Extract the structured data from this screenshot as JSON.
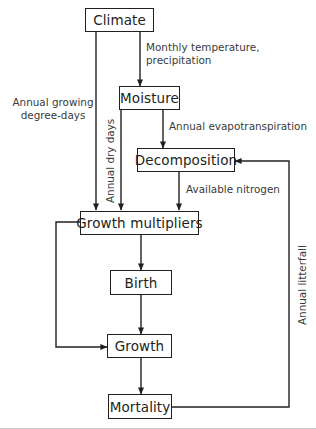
{
  "diagram": {
    "nodes": [
      {
        "id": "climate",
        "label": "Climate"
      },
      {
        "id": "moisture",
        "label": "Moisture"
      },
      {
        "id": "decomposition",
        "label": "Decomposition"
      },
      {
        "id": "growth_multipliers",
        "label": "Growth multipliers"
      },
      {
        "id": "birth",
        "label": "Birth"
      },
      {
        "id": "growth",
        "label": "Growth"
      },
      {
        "id": "mortality",
        "label": "Mortality"
      }
    ],
    "edge_labels": [
      {
        "id": "monthly_temp",
        "line1": "Monthly temperature,",
        "line2": "precipitation"
      },
      {
        "id": "annual_growing",
        "line1": "Annual growing",
        "line2": "degree-days"
      },
      {
        "id": "annual_dry_days",
        "line1": "Annual dry days"
      },
      {
        "id": "annual_evapotranspiration",
        "line1": "Annual evapotranspiration"
      },
      {
        "id": "available_nitrogen",
        "line1": "Available nitrogen"
      },
      {
        "id": "annual_litterfall",
        "line1": "Annual litterfall"
      }
    ],
    "colors": {
      "stroke": "#231f20",
      "label_text": "#3a3a3c",
      "background": "#ffffff",
      "rule": "#c9c9cb"
    }
  }
}
